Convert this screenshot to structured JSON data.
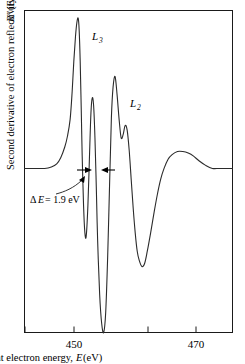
{
  "figure": {
    "title": "",
    "background": "#ffffff",
    "curve_color": "#2b2b2b",
    "axis_color": "#1a1a1a"
  },
  "axes": {
    "x": {
      "label_prefix": "Incident electron energy,",
      "label_symbol": "E",
      "label_units": "(eV)",
      "tick_labels": [
        "450",
        "470"
      ],
      "all_ticks": [
        445,
        450,
        460,
        470
      ],
      "range": [
        443,
        474
      ]
    },
    "y": {
      "label_prefix": "Second derivative of electron reflectivity,",
      "label_symbol": "R",
      "label_prime": "″",
      "label_arg": "(E)",
      "tick_labels": [],
      "range": [
        -1.0,
        1.0
      ]
    }
  },
  "peaks": [
    {
      "id": "L3",
      "letter": "L",
      "subscript": "3",
      "x_px": 97,
      "y_px": 38
    },
    {
      "id": "L2",
      "letter": "L",
      "subscript": "2",
      "x_px": 135,
      "y_px": 105
    }
  ],
  "annotation": {
    "delta": "Δ",
    "symbol": "E",
    "equals_value": "= 1.9 eV",
    "full_text": "ΔE = 1.9 eV",
    "value": 1.9,
    "units": "eV"
  },
  "chart_data": {
    "type": "line",
    "title": "",
    "xlabel": "Incident electron energy, E (eV)",
    "ylabel": "Second derivative of electron reflectivity, R″(E)",
    "xlim": [
      443,
      474
    ],
    "ylim": [
      -1.05,
      1.05
    ],
    "xticks": [
      445,
      450,
      460,
      470
    ],
    "xticklabels": [
      "",
      "450",
      "",
      "470"
    ],
    "yticks": [],
    "grid": false,
    "legend": null,
    "annotations": [
      {
        "text": "L3",
        "x": 450.9,
        "y": 0.95,
        "kind": "peak-label"
      },
      {
        "text": "L2",
        "x": 455.9,
        "y": 0.52,
        "kind": "peak-label"
      },
      {
        "text": "ΔE = 1.9 eV",
        "x": 447.0,
        "y": -0.24,
        "kind": "measurement"
      }
    ],
    "measurement_span": {
      "from_x": 451.3,
      "to_x": 453.2,
      "y": 0.02,
      "label": "ΔE = 1.9 eV"
    },
    "series": [
      {
        "name": "Second derivative of electron reflectivity",
        "x": [
          443.0,
          444.5,
          446.0,
          447.0,
          447.8,
          448.4,
          449.0,
          449.4,
          449.8,
          450.1,
          450.35,
          450.6,
          450.8,
          451.0,
          451.15,
          451.3,
          451.45,
          451.6,
          451.8,
          452.0,
          452.2,
          452.45,
          452.7,
          452.9,
          453.1,
          453.3,
          453.5,
          453.7,
          453.9,
          454.2,
          454.5,
          454.8,
          455.1,
          455.4,
          455.7,
          455.95,
          456.2,
          456.5,
          456.8,
          457.1,
          457.4,
          457.7,
          458.0,
          458.3,
          458.6,
          458.9,
          459.2,
          459.5,
          459.8,
          460.1,
          460.5,
          460.9,
          461.3,
          461.8,
          462.3,
          462.8,
          463.3,
          463.8,
          464.4,
          465.0,
          465.8,
          466.6,
          467.4,
          468.2,
          469.0,
          470.0,
          471.0,
          472.0,
          473.0,
          474.0
        ],
        "y": [
          0.02,
          0.02,
          0.02,
          0.03,
          0.05,
          0.09,
          0.16,
          0.23,
          0.34,
          0.52,
          0.72,
          0.88,
          0.97,
          1.0,
          0.92,
          0.72,
          0.42,
          0.1,
          -0.22,
          -0.4,
          -0.42,
          -0.22,
          0.12,
          0.38,
          0.48,
          0.43,
          0.22,
          -0.1,
          -0.45,
          -0.8,
          -0.99,
          -1.05,
          -0.92,
          -0.55,
          -0.05,
          0.35,
          0.55,
          0.62,
          0.5,
          0.34,
          0.22,
          0.24,
          0.3,
          0.27,
          0.14,
          -0.05,
          -0.24,
          -0.4,
          -0.52,
          -0.58,
          -0.62,
          -0.6,
          -0.52,
          -0.4,
          -0.27,
          -0.15,
          -0.05,
          0.02,
          0.08,
          0.11,
          0.13,
          0.13,
          0.12,
          0.1,
          0.07,
          0.04,
          0.02,
          0.02,
          0.02,
          0.02
        ]
      }
    ]
  }
}
